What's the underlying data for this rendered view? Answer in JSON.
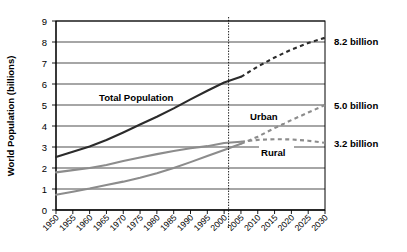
{
  "chart_data": {
    "type": "line",
    "title": "",
    "xlabel": "",
    "ylabel": "World Population (billions)",
    "xlim": [
      1950,
      2030
    ],
    "ylim": [
      0,
      9
    ],
    "grid": true,
    "legend_position": "inline-labels",
    "x": [
      1950,
      1955,
      1960,
      1965,
      1970,
      1975,
      1980,
      1985,
      1990,
      1995,
      2000,
      2005,
      2010,
      2015,
      2020,
      2025,
      2030
    ],
    "x_tick_labels": [
      "1950",
      "1955",
      "1960",
      "1965",
      "1970",
      "1975",
      "1980",
      "1985",
      "1990",
      "1995",
      "2000",
      "2005",
      "2010",
      "2015",
      "2020",
      "2025",
      "2030"
    ],
    "y_tick_labels": [
      "0",
      "1",
      "2",
      "3",
      "4",
      "5",
      "6",
      "7",
      "8",
      "9"
    ],
    "y_ticks": [
      0,
      1,
      2,
      3,
      4,
      5,
      6,
      7,
      8,
      9
    ],
    "projection_start_year": 2005,
    "series": [
      {
        "name": "Total Population",
        "label": "Total Population",
        "color": "#2b2b2b",
        "historical_values": [
          2.52,
          2.77,
          3.02,
          3.33,
          3.69,
          4.07,
          4.44,
          4.84,
          5.27,
          5.68,
          6.07,
          6.34
        ],
        "projected_values": [
          6.34,
          6.83,
          7.26,
          7.64,
          7.95,
          8.2
        ],
        "projected_x": [
          2005,
          2010,
          2015,
          2020,
          2025,
          2030
        ],
        "end_value": 8.2
      },
      {
        "name": "Rural",
        "label": "Rural",
        "color": "#8c8c8c",
        "historical_values": [
          1.79,
          1.9,
          2.0,
          2.14,
          2.33,
          2.5,
          2.66,
          2.81,
          2.94,
          3.04,
          3.19,
          3.25
        ],
        "projected_values": [
          3.25,
          3.34,
          3.37,
          3.36,
          3.3,
          3.2
        ],
        "projected_x": [
          2005,
          2010,
          2015,
          2020,
          2025,
          2030
        ],
        "end_value": 3.2
      },
      {
        "name": "Urban",
        "label": "Urban",
        "color": "#8c8c8c",
        "historical_values": [
          0.73,
          0.87,
          1.02,
          1.19,
          1.35,
          1.54,
          1.75,
          2.0,
          2.28,
          2.57,
          2.86,
          3.15
        ],
        "projected_values": [
          3.15,
          3.49,
          3.9,
          4.28,
          4.64,
          5.0
        ],
        "projected_x": [
          2005,
          2010,
          2015,
          2020,
          2025,
          2030
        ],
        "end_value": 5.0
      }
    ],
    "annotations": [
      {
        "name": "total-end-annotation",
        "text": "8.2 billion",
        "value": 8.2
      },
      {
        "name": "urban-end-annotation",
        "text": "5.0 billion",
        "value": 5.0
      },
      {
        "name": "rural-end-annotation",
        "text": "3.2 billion",
        "value": 3.2
      }
    ],
    "inline_labels": [
      {
        "name": "total-population-label",
        "text": "Total Population"
      },
      {
        "name": "urban-label",
        "text": "Urban"
      },
      {
        "name": "rural-label",
        "text": "Rural"
      }
    ]
  }
}
